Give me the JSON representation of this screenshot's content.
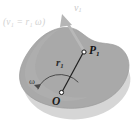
{
  "figure": {
    "background_color": "#ffffff",
    "body": {
      "name": "rigid-body-blob",
      "fill_color": "#a9a9a9",
      "edge_color": "#9a9a9a",
      "shadow_color": "#cfcfcf"
    },
    "labels": {
      "formula": "(v₁ = r₁ ω)",
      "formula_base": "(v",
      "formula_sub1": "1",
      "formula_mid": " = r",
      "formula_sub2": "1",
      "formula_end": " ω)",
      "velocity_base": "v",
      "velocity_sub": "1",
      "radius_base": "r",
      "radius_sub": "1",
      "point_base": "P",
      "point_sub": "1",
      "origin": "O",
      "omega": "ω"
    },
    "markers": {
      "point_p1": {
        "label": "P1",
        "x": 84,
        "y": 52,
        "style": "open-circle"
      },
      "origin_o": {
        "label": "O",
        "x": 61,
        "y": 93,
        "style": "open-circle"
      }
    },
    "vectors": {
      "radius_line": {
        "name": "r1",
        "from": "O",
        "to": "P1"
      },
      "velocity_arrow": {
        "name": "v1",
        "from": "P1",
        "direction": "up-left",
        "perpendicular_to": "r1"
      },
      "rotation_arc": {
        "name": "omega",
        "direction": "counterclockwise",
        "about": "O"
      }
    },
    "colors": {
      "blob_fill": "#a9a9a9",
      "shadow": "#cfcfcf",
      "line_dark": "#1f1f1f",
      "text_faint": "#d0d0d0"
    }
  }
}
